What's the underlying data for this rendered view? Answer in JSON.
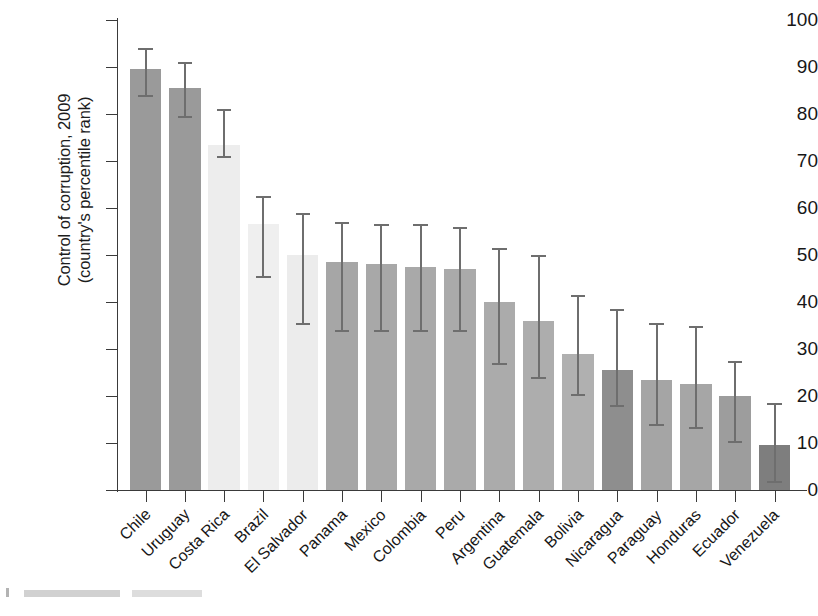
{
  "chart_data": {
    "type": "bar",
    "title": "",
    "xlabel": "",
    "ylabel": "Control of corruption, 2009 (country's percentile rank)",
    "ylabel_line1": "Control of corruption, 2009",
    "ylabel_line2": "(country's percentile rank)",
    "ylim": [
      0,
      100
    ],
    "yticks": [
      0,
      10,
      20,
      30,
      40,
      50,
      60,
      70,
      80,
      90,
      100
    ],
    "ytick_labels": [
      "0",
      "10",
      "20",
      "30",
      "40",
      "50",
      "60",
      "70",
      "80",
      "90",
      "100"
    ],
    "grid": false,
    "legend": "none",
    "error_bars": "95% confidence interval",
    "categories": [
      "Chile",
      "Uruguay",
      "Costa Rica",
      "Brazil",
      "El Salvador",
      "Panama",
      "Mexico",
      "Colombia",
      "Peru",
      "Argentina",
      "Guatemala",
      "Bolivia",
      "Nicaragua",
      "Paraguay",
      "Honduras",
      "Ecuador",
      "Venezuela"
    ],
    "values": [
      89.5,
      85.5,
      73.5,
      56.5,
      50.0,
      48.5,
      48.0,
      47.5,
      47.0,
      40.0,
      36.0,
      29.0,
      25.5,
      23.5,
      22.5,
      20.0,
      9.5
    ],
    "error_low": [
      84.0,
      79.5,
      71.0,
      45.5,
      35.5,
      34.0,
      34.0,
      34.0,
      34.0,
      27.0,
      24.0,
      20.5,
      18.0,
      14.0,
      13.5,
      10.5,
      2.0
    ],
    "error_high": [
      94.0,
      91.0,
      81.0,
      62.5,
      59.0,
      57.0,
      56.5,
      56.5,
      56.0,
      51.5,
      50.0,
      41.5,
      38.5,
      35.5,
      35.0,
      27.5,
      18.5
    ],
    "bar_colors": [
      "#9a9a9a",
      "#9a9a9a",
      "#ededed",
      "#efefef",
      "#ececec",
      "#a6a6a6",
      "#a8a8a8",
      "#a9a9a9",
      "#aaaaaa",
      "#ababab",
      "#adadad",
      "#b0b0b0",
      "#8e8e8e",
      "#a5a5a5",
      "#a6a6a6",
      "#9d9d9d",
      "#7e7e7e"
    ],
    "error_bar_color": "#6e6e6e",
    "axis_color": "#3a3a3a"
  }
}
